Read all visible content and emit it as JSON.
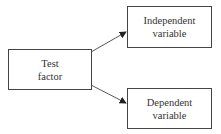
{
  "diagram": {
    "nodes": [
      {
        "id": "test-factor",
        "lines": [
          "Test",
          "factor"
        ]
      },
      {
        "id": "independent-variable",
        "lines": [
          "Independent",
          "variable"
        ]
      },
      {
        "id": "dependent-variable",
        "lines": [
          "Dependent",
          "variable"
        ]
      }
    ],
    "edges": [
      {
        "from": "test-factor",
        "to": "independent-variable"
      },
      {
        "from": "test-factor",
        "to": "dependent-variable"
      }
    ]
  }
}
